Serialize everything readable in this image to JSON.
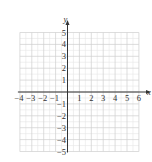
{
  "chart_data": {
    "type": "scatter",
    "title": "",
    "xlabel": "x",
    "ylabel": "y",
    "xlim": [
      -4,
      6
    ],
    "ylim": [
      -5,
      5
    ],
    "grid": true,
    "grid_minor": true,
    "x_ticks": [
      -4,
      -3,
      -2,
      -1,
      1,
      2,
      3,
      4,
      5,
      6
    ],
    "y_ticks": [
      5,
      4,
      3,
      2,
      1,
      -1,
      -2,
      -3,
      -4,
      -5
    ],
    "x_tick_labels": [
      "−4",
      "−3",
      "−2",
      "−1",
      "1",
      "2",
      "3",
      "4",
      "5",
      "6"
    ],
    "y_tick_labels": [
      "5",
      "4",
      "3",
      "2",
      "1",
      "−1",
      "−2",
      "−3",
      "−4",
      "−5"
    ],
    "series": [],
    "legend": null
  },
  "colors": {
    "grid_major": "#cfcfcf",
    "grid_minor": "#e6e6e6",
    "axis": "#333333",
    "text": "#333333"
  }
}
